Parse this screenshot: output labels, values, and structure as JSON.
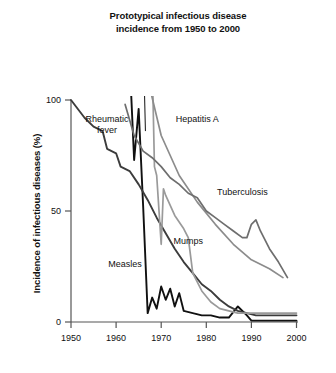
{
  "chart_data": {
    "type": "line",
    "title": "Prototypical infectious disease\nincidence from 1950 to 2000",
    "xlabel": "",
    "ylabel": "Incidence of infectious diseases (%)",
    "xlim": [
      1950,
      2000
    ],
    "ylim": [
      0,
      100
    ],
    "xticks": [
      "1950",
      "1960",
      "1970",
      "1980",
      "1990",
      "2000"
    ],
    "xtick_values": [
      1950,
      1960,
      1970,
      1980,
      1990,
      2000
    ],
    "yticks": [
      "0",
      "50",
      "100"
    ],
    "ytick_values": [
      0,
      50,
      100
    ],
    "grid": false,
    "legend": "inline-annotations",
    "series": [
      {
        "name": "Measles",
        "color": "#111111",
        "label_x": 1962,
        "label_y": 25,
        "points": [
          [
            1963,
            118
          ],
          [
            1964,
            73
          ],
          [
            1965,
            96
          ],
          [
            1966,
            52
          ],
          [
            1967,
            4
          ],
          [
            1968,
            11
          ],
          [
            1969,
            6
          ],
          [
            1970,
            16
          ],
          [
            1971,
            10
          ],
          [
            1972,
            15
          ],
          [
            1973,
            7
          ],
          [
            1974,
            13
          ],
          [
            1975,
            5
          ],
          [
            1977,
            4
          ],
          [
            1979,
            3
          ],
          [
            1981,
            3
          ],
          [
            1983,
            2
          ],
          [
            1985,
            2
          ],
          [
            1987,
            7
          ],
          [
            1989,
            3
          ],
          [
            1990,
            0.6
          ],
          [
            1995,
            0.6
          ],
          [
            2000,
            0.6
          ]
        ]
      },
      {
        "name": "Rheumatic fever",
        "color": "#3c3c3c",
        "label_x": 1958,
        "label_y": 90,
        "leader": [
          [
            1966.5,
            86
          ],
          [
            1966.2,
            112
          ]
        ],
        "points": [
          [
            1950,
            100
          ],
          [
            1953,
            92
          ],
          [
            1955,
            88
          ],
          [
            1957,
            86
          ],
          [
            1958,
            78
          ],
          [
            1960,
            76
          ],
          [
            1961,
            70
          ],
          [
            1963,
            68
          ],
          [
            1965,
            62
          ],
          [
            1967,
            55
          ],
          [
            1969,
            47
          ],
          [
            1971,
            40
          ],
          [
            1973,
            33
          ],
          [
            1975,
            27
          ],
          [
            1977,
            22
          ],
          [
            1979,
            17
          ],
          [
            1981,
            14
          ],
          [
            1983,
            10
          ],
          [
            1985,
            7
          ],
          [
            1987,
            5
          ],
          [
            1989,
            4
          ],
          [
            1991,
            3
          ],
          [
            1993,
            3
          ],
          [
            1996,
            3
          ],
          [
            2000,
            3
          ]
        ]
      },
      {
        "name": "Mumps",
        "color": "#9a9a9a",
        "label_x": 1976,
        "label_y": 35,
        "points": [
          [
            1968,
            118
          ],
          [
            1968.5,
            70
          ],
          [
            1969,
            66
          ],
          [
            1970,
            35
          ],
          [
            1970.5,
            60
          ],
          [
            1971,
            57
          ],
          [
            1973,
            48
          ],
          [
            1975,
            42
          ],
          [
            1976,
            38
          ],
          [
            1977,
            22
          ],
          [
            1979,
            14
          ],
          [
            1981,
            9
          ],
          [
            1983,
            6
          ],
          [
            1985,
            5
          ],
          [
            1987,
            4
          ],
          [
            1989,
            4
          ],
          [
            1991,
            4
          ],
          [
            1994,
            4
          ],
          [
            2000,
            4
          ]
        ]
      },
      {
        "name": "Hepatitis A",
        "color": "#8c8c8c",
        "label_x": 1978,
        "label_y": 90,
        "points": [
          [
            1966,
            118
          ],
          [
            1970,
            84
          ],
          [
            1974,
            66
          ],
          [
            1978,
            54
          ],
          [
            1982,
            44
          ],
          [
            1986,
            35
          ],
          [
            1990,
            28
          ],
          [
            1994,
            24
          ],
          [
            1997,
            20
          ]
        ]
      },
      {
        "name": "Tuberculosis",
        "color": "#6e6e6e",
        "label_x": 1988,
        "label_y": 57,
        "points": [
          [
            1962,
            98
          ],
          [
            1964,
            84
          ],
          [
            1966,
            77
          ],
          [
            1968,
            74
          ],
          [
            1970,
            70
          ],
          [
            1972,
            65
          ],
          [
            1974,
            62
          ],
          [
            1976,
            58
          ],
          [
            1978,
            56
          ],
          [
            1980,
            50
          ],
          [
            1982,
            47
          ],
          [
            1984,
            44
          ],
          [
            1986,
            41
          ],
          [
            1988,
            38
          ],
          [
            1989,
            38
          ],
          [
            1990,
            44
          ],
          [
            1991,
            46
          ],
          [
            1992,
            41
          ],
          [
            1994,
            33
          ],
          [
            1996,
            27
          ],
          [
            1998,
            20
          ]
        ]
      }
    ]
  },
  "axes": {
    "y_title": "Incidence of infectious diseases (%)",
    "x_tick_labels": [
      "1950",
      "1960",
      "1970",
      "1980",
      "1990",
      "2000"
    ],
    "y_tick_labels": [
      "100",
      "50",
      "0"
    ]
  },
  "annotations": {
    "rheumatic_fever": "Rheumatic\nfever",
    "rheumatic_fever_line1": "Rheumatic",
    "rheumatic_fever_line2": "fever",
    "hepatitis_a": "Hepatitis A",
    "tuberculosis": "Tuberculosis",
    "measles": "Measles",
    "mumps": "Mumps"
  },
  "colors": {
    "axis": "#555555",
    "text": "#111111",
    "measles": "#111111",
    "rheumatic_fever": "#3c3c3c",
    "mumps": "#9a9a9a",
    "hepatitis_a": "#8c8c8c",
    "tuberculosis": "#6e6e6e"
  }
}
